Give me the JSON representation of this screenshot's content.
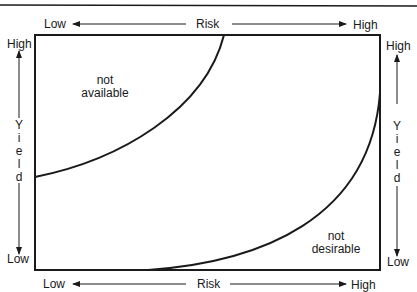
{
  "diagram": {
    "title": "",
    "top_axis": {
      "low_label": "Low",
      "title": "Risk",
      "high_label": "High"
    },
    "bottom_axis": {
      "low_label": "Low",
      "title": "Risk",
      "high_label": "High"
    },
    "left_axis": {
      "high_label": "High",
      "title_letters": [
        "Y",
        "i",
        "e",
        "l",
        "d"
      ],
      "low_label": "Low"
    },
    "right_axis": {
      "high_label": "High",
      "title_letters": [
        "Y",
        "i",
        "e",
        "l",
        "d"
      ],
      "low_label": "Low"
    },
    "regions": [
      {
        "line1": "not",
        "line2": "available"
      },
      {
        "line1": "not",
        "line2": "desirable"
      }
    ],
    "colors": {
      "line": "#1a1a1a",
      "background": "#ffffff"
    }
  }
}
